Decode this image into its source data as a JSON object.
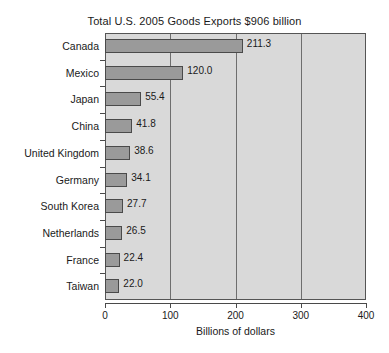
{
  "chart_data": {
    "type": "bar",
    "orientation": "horizontal",
    "title": "Total U.S. 2005 Goods Exports $906 billion",
    "xlabel": "Billions of dollars",
    "ylabel": "",
    "xlim": [
      0,
      400
    ],
    "xticks": [
      0,
      100,
      200,
      300,
      400
    ],
    "xtick_labels": [
      "0",
      "100",
      "200",
      "300",
      "400"
    ],
    "grid": true,
    "grid_axis": "x",
    "legend": null,
    "categories": [
      "Canada",
      "Mexico",
      "Japan",
      "China",
      "United Kingdom",
      "Germany",
      "South Korea",
      "Netherlands",
      "France",
      "Taiwan"
    ],
    "values": [
      211.3,
      120.0,
      55.4,
      41.8,
      38.6,
      34.1,
      27.7,
      26.5,
      22.4,
      22.0
    ],
    "value_labels": [
      "211.3",
      "120.0",
      "55.4",
      "41.8",
      "38.6",
      "34.1",
      "27.7",
      "26.5",
      "22.4",
      "22.0"
    ],
    "colors": {
      "bar_fill": "#9a9a9a",
      "bar_border": "#4a4a4a",
      "plot_background": "#d9d9d9",
      "gridline": "#6e6e6e",
      "axis": "#4a4a4a",
      "text": "#1a1a1a",
      "page_background": "#ffffff"
    }
  }
}
